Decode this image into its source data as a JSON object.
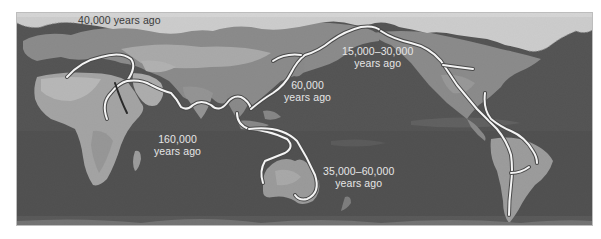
{
  "map": {
    "title": "Human migration routes",
    "colors": {
      "ocean": "#3a3a3a",
      "land": "#9a9a9a",
      "land_light": "#c4c4c4",
      "ice": "#f4f4f4",
      "route": "#f2f2f2",
      "route_outline": "#555555",
      "label_light": "#e6e6e6",
      "label_dark": "#3a3a3a"
    },
    "labels": [
      {
        "id": "europe",
        "lines": [
          "40,000 years ago"
        ],
        "x": 82,
        "y": 13,
        "theme": "dark"
      },
      {
        "id": "east-asia",
        "lines": [
          "60,000",
          "years ago"
        ],
        "x": 290,
        "y": 79,
        "theme": "light"
      },
      {
        "id": "africa-origin",
        "lines": [
          "160,000",
          "years ago"
        ],
        "x": 150,
        "y": 133,
        "theme": "light"
      },
      {
        "id": "beringia",
        "lines": [
          "15,000–30,000",
          "years ago"
        ],
        "x": 343,
        "y": 45,
        "theme": "light"
      },
      {
        "id": "australia",
        "lines": [
          "35,000–60,000",
          "years ago"
        ],
        "x": 323,
        "y": 163,
        "theme": "light"
      }
    ]
  }
}
